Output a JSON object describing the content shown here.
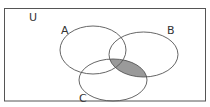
{
  "diagram": {
    "type": "venn",
    "universe_label": "U",
    "sets": [
      {
        "label": "A"
      },
      {
        "label": "B"
      },
      {
        "label": "C"
      }
    ],
    "shaded_region": "B ∩ C",
    "colors": {
      "outline": "#555555",
      "shade": "#9a9a9a",
      "background": "#ffffff"
    }
  }
}
